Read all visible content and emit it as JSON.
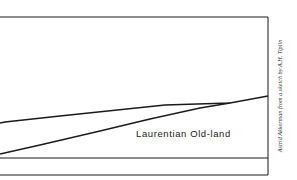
{
  "diagram": {
    "label": "Laurentian Old-land",
    "credit": "Astrid Akkerman from a sketch by A.H. Tiplin",
    "line_color": "#1a1a1a"
  }
}
